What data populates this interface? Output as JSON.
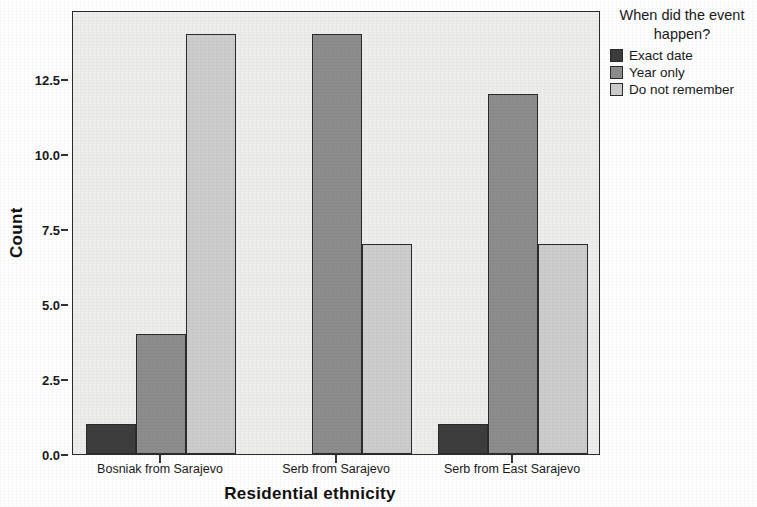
{
  "chart_data": {
    "type": "bar",
    "title": "",
    "xlabel": "Residential ethnicity",
    "ylabel": "Count",
    "categories": [
      "Bosniak from Sarajevo",
      "Serb from Sarajevo",
      "Serb from East Sarajevo"
    ],
    "series": [
      {
        "name": "Exact date",
        "color": "#3d3d3d",
        "values": [
          1,
          0,
          1
        ]
      },
      {
        "name": "Year only",
        "color": "#8d8d8d",
        "values": [
          4,
          14,
          12
        ]
      },
      {
        "name": "Do not remember",
        "color": "#cccccc",
        "values": [
          14,
          7,
          7
        ]
      }
    ],
    "ylim": [
      0,
      14.8
    ],
    "yticks": [
      "0.0",
      "2.5",
      "5.0",
      "7.5",
      "10.0",
      "12.5"
    ],
    "ytick_values": [
      0,
      2.5,
      5,
      7.5,
      10,
      12.5
    ],
    "grid": false,
    "legend_position": "right",
    "legend_title": "When did the event happen?",
    "plot_background": "#ededeb",
    "axis_color": "#2b2b2b"
  },
  "legend": {
    "title_line1": "When did the event",
    "title_line2": "happen?",
    "items": [
      {
        "label": "Exact date"
      },
      {
        "label": "Year only"
      },
      {
        "label": "Do not remember"
      }
    ]
  },
  "axes": {
    "y_title": "Count",
    "x_title": "Residential ethnicity"
  }
}
